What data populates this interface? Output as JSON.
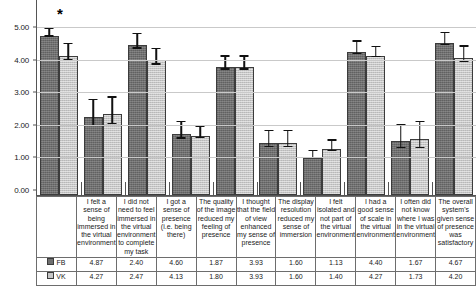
{
  "chart_data": {
    "type": "bar",
    "title": "",
    "xlabel": "",
    "ylabel": "",
    "ylim": [
      0,
      5
    ],
    "grid": true,
    "legend_position": "table-left",
    "y_ticks": [
      "0.00",
      "1.00",
      "2.00",
      "3.00",
      "4.00",
      "5.00"
    ],
    "y_tick_values": [
      0,
      1,
      2,
      3,
      4,
      5
    ],
    "categories": [
      "I felt a sense of being immersed in the virtual environment",
      "I did not need to feel immersed in the virtual environment to complete my task",
      "I got a sense of presence (i.e. being there)",
      "The quality of the image reduced my feeling of presence",
      "I thought that the field of view enhanced my sense of presence",
      "The display resolution reduced my sense of immersion",
      "I felt isolated and not part of the virtual environment",
      "I had a good sense of scale in the virtual environment",
      "I often did not know where I was in the virtual environment",
      "The overall system's given sense of presence was satisfactory"
    ],
    "series": [
      {
        "name": "FB",
        "color": "#6f6f6f",
        "values": [
          4.87,
          2.4,
          4.6,
          1.87,
          3.93,
          1.6,
          1.13,
          4.4,
          1.67,
          4.67
        ],
        "errors": [
          0.13,
          0.4,
          0.22,
          0.25,
          0.2,
          0.25,
          0.11,
          0.19,
          0.34,
          0.18
        ]
      },
      {
        "name": "VK",
        "color": "#c6c6c6",
        "values": [
          4.27,
          2.47,
          4.13,
          1.8,
          3.93,
          1.6,
          1.4,
          4.27,
          1.73,
          4.2
        ],
        "errors": [
          0.24,
          0.4,
          0.24,
          0.17,
          0.2,
          0.25,
          0.16,
          0.15,
          0.4,
          0.24
        ]
      }
    ],
    "annotations": [
      {
        "label": "*",
        "category_index": 0,
        "meaning": "significant-difference"
      }
    ]
  },
  "table": {
    "column_headers": [
      "I felt a sense of being immersed in the virtual environment",
      "I did not need to feel immersed in the virtual environment to complete my task",
      "I got a sense of presence (i.e. being there)",
      "The quality of the image reduced my feeling of presence",
      "I thought that the field of view enhanced my sense of presence",
      "The display resolution reduced my sense of immersion",
      "I felt isolated and not part of the virtual environment",
      "I had a good sense of scale in the virtual environment",
      "I often did not know where I was in the virtual environment",
      "The overall system's given sense of presence was satisfactory"
    ],
    "rows": [
      {
        "legend_label": "FB",
        "values": [
          "4.87",
          "2.40",
          "4.60",
          "1.87",
          "3.93",
          "1.60",
          "1.13",
          "4.40",
          "1.67",
          "4.67"
        ]
      },
      {
        "legend_label": "VK",
        "values": [
          "4.27",
          "2.47",
          "4.13",
          "1.80",
          "3.93",
          "1.60",
          "1.40",
          "4.27",
          "1.73",
          "4.20"
        ]
      }
    ]
  },
  "colors": {
    "series_fb": "#6f6f6f",
    "series_vk": "#c6c6c6",
    "gridline": "#c9c9c9",
    "axis": "#555555",
    "error_bar": "#111111",
    "table_border": "#6d6d6d"
  }
}
